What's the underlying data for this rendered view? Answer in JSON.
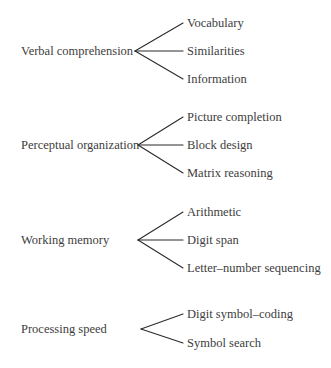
{
  "diagram": {
    "type": "tree",
    "line_color": "#2b2b2b",
    "text_color": "#3d3d3d",
    "groups": [
      {
        "factor": "Verbal comprehension",
        "subtests": [
          "Vocabulary",
          "Similarities",
          "Information"
        ]
      },
      {
        "factor": "Perceptual organization",
        "subtests": [
          "Picture completion",
          "Block design",
          "Matrix reasoning"
        ]
      },
      {
        "factor": "Working memory",
        "subtests": [
          "Arithmetic",
          "Digit span",
          "Letter–number sequencing"
        ]
      },
      {
        "factor": "Processing speed",
        "subtests": [
          "Digit symbol–coding",
          "Symbol search"
        ]
      }
    ]
  }
}
